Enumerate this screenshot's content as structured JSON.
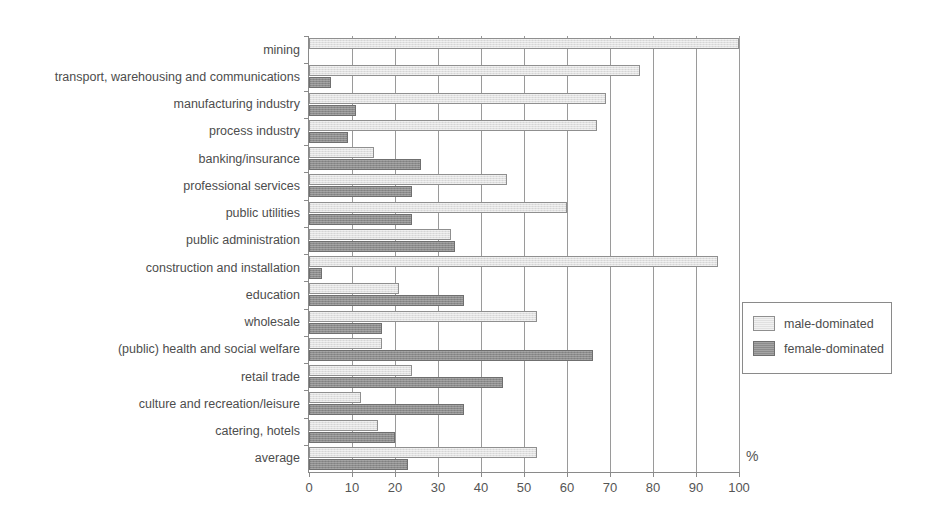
{
  "chart_data": {
    "type": "bar",
    "orientation": "horizontal",
    "title": "",
    "subtitle": "",
    "xlabel": "%",
    "ylabel": "",
    "xlim": [
      0,
      100
    ],
    "xticks": [
      0,
      10,
      20,
      30,
      40,
      50,
      60,
      70,
      80,
      90,
      100
    ],
    "xticklabels": [
      "0",
      "10",
      "20",
      "30",
      "40",
      "50",
      "60",
      "70",
      "80",
      "90",
      "100"
    ],
    "grid": "vertical",
    "legend_position": "right",
    "categories": [
      "mining",
      "transport, warehousing and communications",
      "manufacturing industry",
      "process industry",
      "banking/insurance",
      "professional services",
      "public utilities",
      "public administration",
      "construction and installation",
      "education",
      "wholesale",
      "(public) health and social welfare",
      "retail trade",
      "culture and recreation/leisure",
      "catering, hotels",
      "average"
    ],
    "series": [
      {
        "name": "male-dominated",
        "color": "#e0e0e0",
        "values": [
          100,
          77,
          69,
          67,
          15,
          46,
          60,
          33,
          95,
          21,
          53,
          17,
          24,
          12,
          16,
          53
        ]
      },
      {
        "name": "female-dominated",
        "color": "#8c8c8c",
        "values": [
          0,
          5,
          11,
          9,
          26,
          24,
          24,
          34,
          3,
          36,
          17,
          66,
          45,
          36,
          20,
          23
        ]
      }
    ]
  },
  "legend": {
    "items": [
      {
        "label": "male-dominated",
        "swatch": "male"
      },
      {
        "label": "female-dominated",
        "swatch": "female"
      }
    ]
  },
  "axis": {
    "unit_label": "%"
  }
}
